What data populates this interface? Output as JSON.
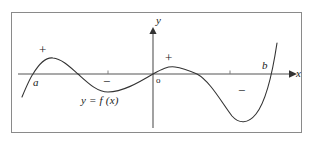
{
  "figure": {
    "name": "sign-diagram-of-function",
    "frame": {
      "border_color": "#8a8a8a"
    },
    "axes": {
      "x_axis_label": "x",
      "y_axis_label": "y",
      "origin_label": "o",
      "axis_color": "#555555",
      "x_axis_y_px": 74,
      "y_axis_x_px": 153
    },
    "curve": {
      "label": "y = f (x)",
      "color": "#333333",
      "path": "M 22 97 C 27 85 30 78 33 74 C 39 64 46 57 53 58 C 62 59 70 67 78 74 C 88 83 97 92 108 92 C 122 92 138 83 153 74 C 162 69 168 66 175 67 C 183 68 190 71 197 74 C 210 81 222 103 232 116 C 239 124 248 124 256 114 C 264 104 271 83 277 43"
    },
    "points": [
      {
        "name": "a",
        "label": "a",
        "x_px": 32
      },
      {
        "name": "b",
        "label": "b",
        "x_px": 273
      }
    ],
    "ticks": [
      {
        "name": "x-tick-left",
        "x_px": 108
      },
      {
        "name": "x-tick-right",
        "x_px": 230
      }
    ],
    "sign_annotations": [
      {
        "name": "plus-region-1",
        "symbol": "+"
      },
      {
        "name": "minus-region-1",
        "symbol": "−"
      },
      {
        "name": "plus-region-2",
        "symbol": "+"
      },
      {
        "name": "minus-region-2",
        "symbol": "−"
      }
    ]
  },
  "chart_data": {
    "type": "line",
    "title": "",
    "xlabel": "x",
    "ylabel": "y",
    "series_name": "y = f (x)",
    "grid": false,
    "legend": "none",
    "roots_labeled": [
      "a",
      "o",
      "b"
    ],
    "sign_regions": [
      {
        "interval": "x < a",
        "sign": "−"
      },
      {
        "interval": "a to first crossing",
        "sign": "+"
      },
      {
        "interval": "between crossings before o",
        "sign": "−"
      },
      {
        "interval": "o to next crossing",
        "sign": "+"
      },
      {
        "interval": "before b",
        "sign": "−"
      },
      {
        "interval": "x > b",
        "sign": "+"
      }
    ],
    "annotations": [
      "+",
      "−",
      "+",
      "−",
      "a",
      "b",
      "o",
      "y = f (x)"
    ]
  }
}
